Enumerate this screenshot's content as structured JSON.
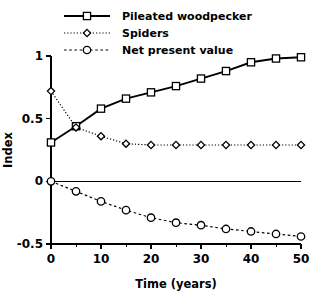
{
  "chart_data": {
    "type": "line",
    "title": "",
    "xlabel": "Time  (years)",
    "ylabel": "Index",
    "xlim": [
      0,
      50
    ],
    "ylim": [
      -0.5,
      1.0
    ],
    "x": [
      0,
      5,
      10,
      15,
      20,
      25,
      30,
      35,
      40,
      45,
      50
    ],
    "xticks": [
      0,
      10,
      20,
      30,
      40,
      50
    ],
    "xtick_labels": [
      "0",
      "10",
      "20",
      "30",
      "40",
      "50"
    ],
    "xticks_minor": [
      5,
      15,
      25,
      35,
      45
    ],
    "yticks": [
      1,
      0.5,
      0,
      -0.5
    ],
    "ytick_labels": [
      "1",
      "0.5",
      "0",
      "-0.5"
    ],
    "grid": false,
    "legend_position": "top-center",
    "zero_reference_line": true,
    "series": [
      {
        "name": "Pileated woodpecker",
        "marker": "square",
        "linestyle": "solid",
        "color": "#000000",
        "values": [
          0.31,
          0.44,
          0.58,
          0.66,
          0.71,
          0.76,
          0.82,
          0.88,
          0.95,
          0.98,
          0.99
        ]
      },
      {
        "name": "Spiders",
        "marker": "diamond",
        "linestyle": "dotted",
        "color": "#000000",
        "values": [
          0.72,
          0.43,
          0.36,
          0.3,
          0.29,
          0.29,
          0.29,
          0.29,
          0.29,
          0.29,
          0.29
        ]
      },
      {
        "name": "Net present value",
        "marker": "circle",
        "linestyle": "dashed",
        "color": "#000000",
        "values": [
          0.0,
          -0.08,
          -0.16,
          -0.23,
          -0.29,
          -0.33,
          -0.35,
          -0.38,
          -0.4,
          -0.42,
          -0.44
        ]
      }
    ]
  },
  "legend": {
    "items": [
      {
        "label": "Pileated woodpecker",
        "marker": "square",
        "linestyle": "solid"
      },
      {
        "label": "Spiders",
        "marker": "diamond",
        "linestyle": "dotted"
      },
      {
        "label": "Net present value",
        "marker": "circle",
        "linestyle": "dashed"
      }
    ]
  },
  "axes": {
    "x_title": "Time  (years)",
    "y_title": "Index"
  }
}
